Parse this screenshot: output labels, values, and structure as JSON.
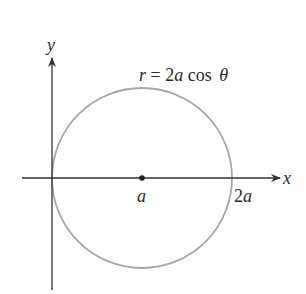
{
  "diagram": {
    "equation": {
      "r": "r",
      "eq": " = 2",
      "a": "a",
      "cos": " cos ",
      "theta": "θ"
    },
    "axes": {
      "x_label": "x",
      "y_label": "y"
    },
    "points": {
      "center_label": "a",
      "right_label_num": "2",
      "right_label_var": "a"
    },
    "colors": {
      "curve": "#a8a8a8",
      "axis": "#333333",
      "text": "#2a2a2a"
    }
  }
}
